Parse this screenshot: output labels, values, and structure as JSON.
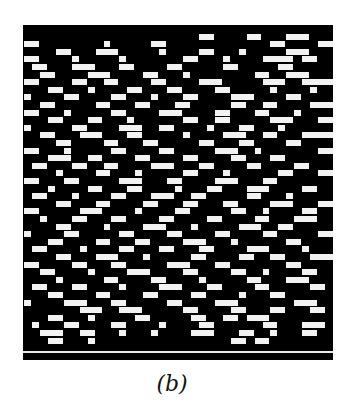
{
  "figure": {
    "caption": "(b)",
    "background_color": "#000000",
    "foreground_color": "#f2f2f2",
    "grid": {
      "cols": 39,
      "rows": 43,
      "cell_width": 7.95,
      "cell_height": 7.6
    },
    "separator_row_y": 326,
    "pattern_rows": [
      [
        [
          0,
          0
        ]
      ],
      [
        [
          22,
          2
        ],
        [
          28,
          2
        ],
        [
          33,
          3
        ]
      ],
      [
        [
          0,
          2
        ],
        [
          10,
          1
        ],
        [
          16,
          2
        ],
        [
          31,
          2
        ],
        [
          37,
          2
        ]
      ],
      [
        [
          4,
          2
        ],
        [
          9,
          3
        ],
        [
          17,
          1
        ],
        [
          22,
          2
        ],
        [
          27,
          1
        ],
        [
          33,
          3
        ]
      ],
      [
        [
          0,
          2
        ],
        [
          6,
          1
        ],
        [
          12,
          1
        ],
        [
          20,
          2
        ],
        [
          25,
          1
        ],
        [
          30,
          4
        ],
        [
          35,
          2
        ]
      ],
      [
        [
          1,
          2
        ],
        [
          6,
          3
        ],
        [
          12,
          2
        ],
        [
          18,
          2
        ],
        [
          25,
          2
        ],
        [
          32,
          2
        ]
      ],
      [
        [
          2,
          2
        ],
        [
          8,
          3
        ],
        [
          15,
          2
        ],
        [
          20,
          1
        ],
        [
          29,
          2
        ],
        [
          33,
          3
        ]
      ],
      [
        [
          0,
          2
        ],
        [
          6,
          2
        ],
        [
          10,
          2
        ],
        [
          16,
          2
        ],
        [
          22,
          3
        ],
        [
          30,
          3
        ],
        [
          35,
          4
        ]
      ],
      [
        [
          3,
          2
        ],
        [
          8,
          1
        ],
        [
          13,
          2
        ],
        [
          18,
          2
        ],
        [
          24,
          2
        ],
        [
          31,
          1
        ],
        [
          36,
          1
        ]
      ],
      [
        [
          0,
          1
        ],
        [
          5,
          2
        ],
        [
          11,
          2
        ],
        [
          16,
          1
        ],
        [
          20,
          2
        ],
        [
          26,
          3
        ],
        [
          33,
          2
        ]
      ],
      [
        [
          2,
          2
        ],
        [
          9,
          2
        ],
        [
          14,
          2
        ],
        [
          19,
          2
        ],
        [
          26,
          2
        ],
        [
          30,
          2
        ],
        [
          36,
          3
        ]
      ],
      [
        [
          0,
          2
        ],
        [
          5,
          1
        ],
        [
          11,
          2
        ],
        [
          17,
          3
        ],
        [
          24,
          2
        ],
        [
          29,
          2
        ],
        [
          34,
          1
        ]
      ],
      [
        [
          3,
          2
        ],
        [
          8,
          2
        ],
        [
          13,
          1
        ],
        [
          20,
          2
        ],
        [
          24,
          2
        ],
        [
          31,
          3
        ],
        [
          37,
          2
        ]
      ],
      [
        [
          0,
          1
        ],
        [
          6,
          2
        ],
        [
          12,
          3
        ],
        [
          17,
          2
        ],
        [
          23,
          1
        ],
        [
          27,
          2
        ],
        [
          32,
          1
        ]
      ],
      [
        [
          2,
          2
        ],
        [
          7,
          3
        ],
        [
          13,
          2
        ],
        [
          20,
          1
        ],
        [
          25,
          3
        ],
        [
          30,
          2
        ],
        [
          35,
          4
        ]
      ],
      [
        [
          4,
          2
        ],
        [
          10,
          2
        ],
        [
          15,
          2
        ],
        [
          22,
          2
        ],
        [
          27,
          2
        ],
        [
          33,
          2
        ]
      ],
      [
        [
          0,
          2
        ],
        [
          5,
          1
        ],
        [
          11,
          2
        ],
        [
          17,
          2
        ],
        [
          24,
          3
        ],
        [
          29,
          1
        ],
        [
          37,
          2
        ]
      ],
      [
        [
          3,
          3
        ],
        [
          8,
          2
        ],
        [
          14,
          2
        ],
        [
          20,
          2
        ],
        [
          26,
          2
        ],
        [
          31,
          2
        ]
      ],
      [
        [
          1,
          2
        ],
        [
          6,
          2
        ],
        [
          10,
          2
        ],
        [
          16,
          3
        ],
        [
          22,
          2
        ],
        [
          28,
          2
        ],
        [
          34,
          2
        ]
      ],
      [
        [
          4,
          1
        ],
        [
          9,
          2
        ],
        [
          14,
          1
        ],
        [
          20,
          2
        ],
        [
          25,
          1
        ],
        [
          32,
          2
        ],
        [
          37,
          2
        ]
      ],
      [
        [
          0,
          2
        ],
        [
          5,
          2
        ],
        [
          12,
          3
        ],
        [
          18,
          2
        ],
        [
          24,
          3
        ],
        [
          30,
          2
        ]
      ],
      [
        [
          3,
          1
        ],
        [
          8,
          2
        ],
        [
          13,
          2
        ],
        [
          19,
          1
        ],
        [
          23,
          2
        ],
        [
          28,
          3
        ],
        [
          35,
          2
        ]
      ],
      [
        [
          1,
          2
        ],
        [
          6,
          1
        ],
        [
          11,
          2
        ],
        [
          16,
          3
        ],
        [
          21,
          2
        ],
        [
          28,
          2
        ],
        [
          33,
          1
        ]
      ],
      [
        [
          4,
          2
        ],
        [
          9,
          2
        ],
        [
          15,
          2
        ],
        [
          20,
          2
        ],
        [
          25,
          2
        ],
        [
          31,
          3
        ],
        [
          37,
          2
        ]
      ],
      [
        [
          0,
          2
        ],
        [
          7,
          3
        ],
        [
          14,
          1
        ],
        [
          19,
          2
        ],
        [
          26,
          2
        ],
        [
          30,
          1
        ],
        [
          35,
          2
        ]
      ],
      [
        [
          2,
          1
        ],
        [
          6,
          2
        ],
        [
          11,
          2
        ],
        [
          17,
          2
        ],
        [
          23,
          2
        ],
        [
          29,
          2
        ],
        [
          34,
          3
        ]
      ],
      [
        [
          4,
          2
        ],
        [
          10,
          1
        ],
        [
          15,
          3
        ],
        [
          21,
          1
        ],
        [
          27,
          3
        ],
        [
          32,
          2
        ]
      ],
      [
        [
          0,
          1
        ],
        [
          5,
          2
        ],
        [
          12,
          2
        ],
        [
          18,
          2
        ],
        [
          24,
          2
        ],
        [
          30,
          2
        ],
        [
          37,
          2
        ]
      ],
      [
        [
          3,
          2
        ],
        [
          9,
          2
        ],
        [
          14,
          2
        ],
        [
          20,
          3
        ],
        [
          26,
          1
        ],
        [
          33,
          2
        ]
      ],
      [
        [
          1,
          2
        ],
        [
          7,
          1
        ],
        [
          12,
          2
        ],
        [
          17,
          2
        ],
        [
          22,
          2
        ],
        [
          28,
          3
        ],
        [
          35,
          1
        ]
      ],
      [
        [
          4,
          2
        ],
        [
          9,
          3
        ],
        [
          15,
          1
        ],
        [
          21,
          2
        ],
        [
          27,
          2
        ],
        [
          31,
          2
        ],
        [
          36,
          3
        ]
      ],
      [
        [
          0,
          2
        ],
        [
          6,
          2
        ],
        [
          11,
          2
        ],
        [
          18,
          3
        ],
        [
          24,
          2
        ],
        [
          33,
          2
        ]
      ],
      [
        [
          2,
          2
        ],
        [
          8,
          1
        ],
        [
          13,
          3
        ],
        [
          20,
          2
        ],
        [
          26,
          2
        ],
        [
          30,
          1
        ],
        [
          35,
          2
        ]
      ],
      [
        [
          4,
          1
        ],
        [
          10,
          2
        ],
        [
          16,
          2
        ],
        [
          22,
          1
        ],
        [
          28,
          2
        ],
        [
          33,
          3
        ]
      ],
      [
        [
          1,
          2
        ],
        [
          6,
          2
        ],
        [
          12,
          1
        ],
        [
          17,
          3
        ],
        [
          23,
          2
        ],
        [
          29,
          2
        ],
        [
          36,
          2
        ]
      ],
      [
        [
          3,
          2
        ],
        [
          9,
          2
        ],
        [
          15,
          2
        ],
        [
          21,
          2
        ],
        [
          27,
          1
        ],
        [
          31,
          2
        ]
      ],
      [
        [
          0,
          1
        ],
        [
          5,
          3
        ],
        [
          11,
          2
        ],
        [
          18,
          2
        ],
        [
          24,
          3
        ],
        [
          34,
          3
        ]
      ],
      [
        [
          7,
          3
        ],
        [
          12,
          3
        ],
        [
          20,
          2
        ],
        [
          26,
          2
        ],
        [
          31,
          2
        ],
        [
          36,
          2
        ]
      ],
      [
        [
          3,
          2
        ],
        [
          8,
          1
        ],
        [
          14,
          2
        ],
        [
          21,
          2
        ],
        [
          25,
          2
        ],
        [
          28,
          3
        ]
      ],
      [
        [
          1,
          1
        ],
        [
          5,
          2
        ],
        [
          11,
          2
        ],
        [
          17,
          1
        ],
        [
          22,
          2
        ],
        [
          30,
          2
        ],
        [
          35,
          3
        ]
      ],
      [
        [
          2,
          3
        ],
        [
          7,
          2
        ],
        [
          12,
          1
        ],
        [
          16,
          1
        ],
        [
          21,
          3
        ],
        [
          27,
          2
        ],
        [
          31,
          1
        ],
        [
          35,
          2
        ]
      ],
      [
        [
          3,
          2
        ],
        [
          8,
          1
        ],
        [
          26,
          2
        ],
        [
          29,
          2
        ]
      ],
      [
        [
          0,
          0
        ]
      ]
    ]
  }
}
